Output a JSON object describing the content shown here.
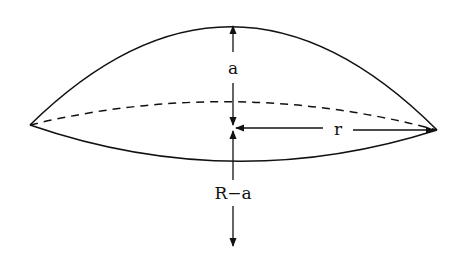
{
  "diagram": {
    "labels": {
      "cap_height": "a",
      "radius_base": "r",
      "center_offset": "R−a"
    },
    "colors": {
      "stroke": "#111111",
      "background": "#ffffff"
    }
  }
}
